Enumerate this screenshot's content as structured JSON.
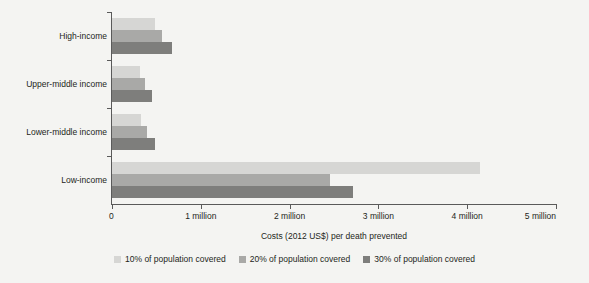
{
  "chart_data": {
    "type": "bar",
    "orientation": "horizontal",
    "title": "",
    "xlabel": "Costs (2012 US$) per death prevented",
    "ylabel": "Country income level",
    "categories": [
      "High-income",
      "Upper-middle income",
      "Lower-middle income",
      "Low-income"
    ],
    "series": [
      {
        "name": "10% of population covered",
        "color": "#d6d6d4",
        "values": [
          480000,
          310000,
          330000,
          4140000
        ]
      },
      {
        "name": "20% of population covered",
        "color": "#a9a9a7",
        "values": [
          560000,
          370000,
          390000,
          2450000
        ]
      },
      {
        "name": "30% of population covered",
        "color": "#7e7e7c",
        "values": [
          680000,
          450000,
          480000,
          2710000
        ]
      }
    ],
    "xlim": [
      0,
      5000000
    ],
    "x_ticks": [
      0,
      1000000,
      2000000,
      3000000,
      4000000,
      5000000
    ],
    "x_tick_labels": [
      "0",
      "1 million",
      "2 million",
      "3 million",
      "4 million",
      "5 million"
    ],
    "grid": false,
    "legend_position": "bottom",
    "units": "2012 US$"
  },
  "background_color": "#f4f4f2",
  "axis_color": "#5a5a5a",
  "text_color": "#231f20"
}
